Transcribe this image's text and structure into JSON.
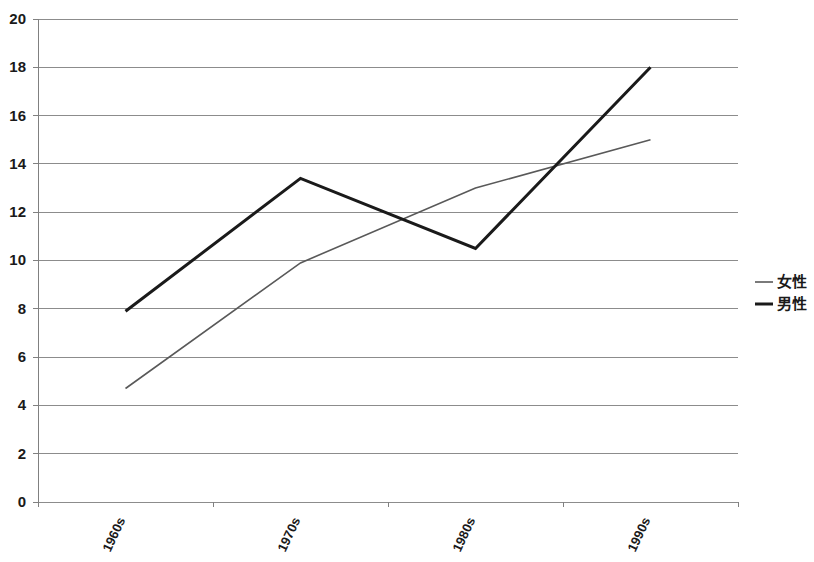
{
  "chart_data": {
    "type": "line",
    "title": "",
    "subtitle": "",
    "xlabel": "",
    "ylabel": "",
    "categories": [
      "1960s",
      "1970s",
      "1980s",
      "1990s"
    ],
    "series": [
      {
        "name": "女性",
        "values": [
          4.7,
          9.9,
          13.0,
          15.0
        ],
        "color": "#595959",
        "line_width": 1.6
      },
      {
        "name": "男性",
        "values": [
          7.9,
          13.4,
          10.5,
          18.0
        ],
        "color": "#1a1a1a",
        "line_width": 3.0
      }
    ],
    "ylim": [
      0,
      20
    ],
    "ytick_step": 2,
    "ytick_labels": [
      "0",
      "2",
      "4",
      "6",
      "8",
      "10",
      "12",
      "14",
      "16",
      "18",
      "20"
    ],
    "grid": true,
    "grid_color": "#8c8c8c",
    "axis_color": "#808080",
    "legend_position": "right",
    "xtick_rotation": -65
  },
  "legend": {
    "items": [
      {
        "label": "女性",
        "marker": "line-swatch-gray"
      },
      {
        "label": "男性",
        "marker": "line-swatch-black"
      }
    ]
  },
  "plot_area": {
    "left": 38,
    "top": 19,
    "right": 738,
    "bottom": 502
  }
}
